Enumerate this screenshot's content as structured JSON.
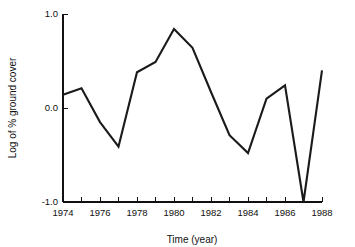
{
  "chart_data": {
    "type": "line",
    "title": "",
    "xlabel": "Time (year)",
    "ylabel": "Log of % ground cover",
    "xlim": [
      1974,
      1988
    ],
    "ylim": [
      -1.0,
      1.0
    ],
    "grid": false,
    "legend": "none",
    "x_tick_values": [
      1974,
      1975,
      1976,
      1977,
      1978,
      1979,
      1980,
      1981,
      1982,
      1983,
      1984,
      1985,
      1986,
      1987,
      1988
    ],
    "x_tick_labels": [
      "1974",
      "",
      "1976",
      "",
      "1978",
      "",
      "1980",
      "",
      "1982",
      "",
      "1984",
      "",
      "1986",
      "",
      "1988"
    ],
    "y_tick_values": [
      -1.0,
      0.0,
      1.0
    ],
    "y_tick_labels": [
      "-1.0",
      "0.0",
      "1.0"
    ],
    "series": [
      {
        "name": "Log of % ground cover",
        "color": "#1a1a1a",
        "x": [
          1974,
          1975,
          1976,
          1977,
          1978,
          1979,
          1980,
          1981,
          1982,
          1983,
          1984,
          1985,
          1986,
          1987,
          1988
        ],
        "values": [
          0.14,
          0.21,
          -0.15,
          -0.41,
          0.38,
          0.49,
          0.84,
          0.64,
          0.17,
          -0.29,
          -0.48,
          0.1,
          0.24,
          -1.0,
          0.4
        ]
      }
    ]
  },
  "axis": {
    "x_title": "Time (year)",
    "y_title": "Log of % ground cover"
  }
}
